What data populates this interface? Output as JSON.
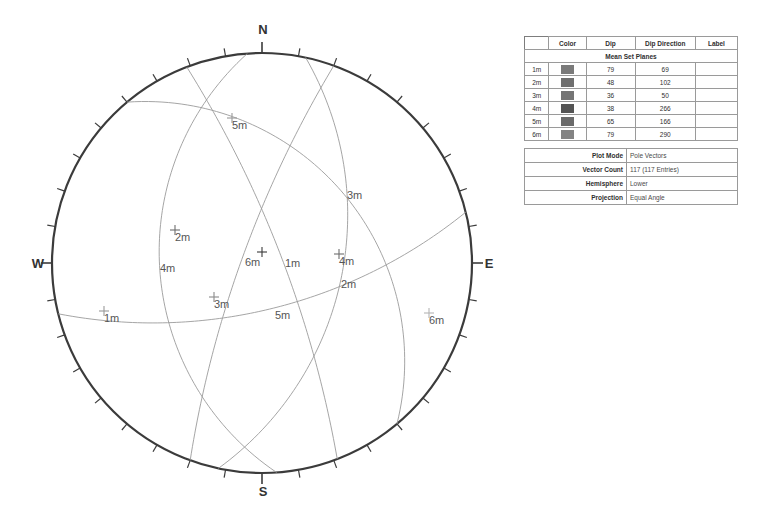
{
  "stereonet": {
    "cardinals": [
      {
        "label": "N",
        "x": 263,
        "y": 34
      },
      {
        "label": "E",
        "x": 489,
        "y": 268
      },
      {
        "label": "S",
        "x": 263,
        "y": 496
      },
      {
        "label": "W",
        "x": 38,
        "y": 268
      }
    ],
    "center": {
      "x": 262,
      "y": 263
    },
    "radius": 210,
    "tick_interval_deg": 10,
    "great_circle_labels": [
      {
        "text": "1m",
        "x": 285,
        "y": 267
      },
      {
        "text": "2m",
        "x": 341,
        "y": 288
      },
      {
        "text": "3m",
        "x": 347,
        "y": 199
      },
      {
        "text": "4m",
        "x": 160,
        "y": 272
      },
      {
        "text": "5m",
        "x": 275,
        "y": 319
      },
      {
        "text": "6m",
        "x": 245,
        "y": 266
      }
    ],
    "pole_markers": [
      {
        "text": "1m",
        "x": 104,
        "y": 322,
        "color": "#9a9a9a"
      },
      {
        "text": "2m",
        "x": 175,
        "y": 241,
        "color": "#6e6e6e"
      },
      {
        "text": "3m",
        "x": 214,
        "y": 308,
        "color": "#8a8a8a"
      },
      {
        "text": "4m",
        "x": 339,
        "y": 265,
        "color": "#6e6e6e"
      },
      {
        "text": "5m",
        "x": 232,
        "y": 129,
        "color": "#9a9a9a"
      },
      {
        "text": "6m",
        "x": 429,
        "y": 324,
        "color": "#b5b5b5"
      },
      {
        "text": "",
        "x": 262,
        "y": 263,
        "color": "#3a3a3a"
      }
    ],
    "colors": {
      "outline": "#3b3b3b",
      "great_circle": "#9b9b9b",
      "tick": "#3b3b3b"
    }
  },
  "sets_table": {
    "headers": [
      "",
      "Color",
      "Dip",
      "Dip Direction",
      "Label"
    ],
    "banner": "Mean Set Planes",
    "rows": [
      {
        "id": "1m",
        "color": "#7a7a7a",
        "dip": "79",
        "dip_direction": "69",
        "label": ""
      },
      {
        "id": "2m",
        "color": "#6f6f6f",
        "dip": "48",
        "dip_direction": "102",
        "label": ""
      },
      {
        "id": "3m",
        "color": "#757575",
        "dip": "36",
        "dip_direction": "50",
        "label": ""
      },
      {
        "id": "4m",
        "color": "#545454",
        "dip": "38",
        "dip_direction": "266",
        "label": ""
      },
      {
        "id": "5m",
        "color": "#6a6a6a",
        "dip": "65",
        "dip_direction": "166",
        "label": ""
      },
      {
        "id": "6m",
        "color": "#838383",
        "dip": "79",
        "dip_direction": "290",
        "label": ""
      }
    ]
  },
  "info_table": {
    "rows": [
      {
        "key": "Plot Mode",
        "value": "Pole Vectors"
      },
      {
        "key": "Vector Count",
        "value": "117 (117 Entries)"
      },
      {
        "key": "Hemisphere",
        "value": "Lower"
      },
      {
        "key": "Projection",
        "value": "Equal Angle"
      }
    ]
  }
}
